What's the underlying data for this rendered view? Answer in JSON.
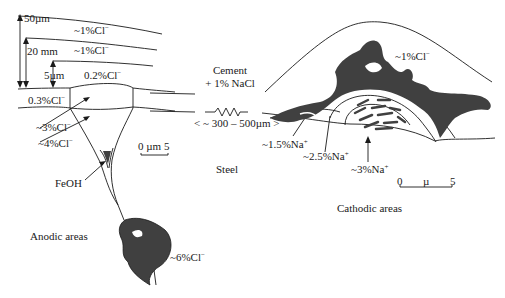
{
  "figure": {
    "type": "schematic diagram"
  },
  "colors": {
    "line": "#1a1a1a",
    "fill_dark": "#404040",
    "background": "#ffffff"
  },
  "left_panel": {
    "dimensions": {
      "outer": "50µm",
      "middle": "20 mm",
      "inner": "5µm"
    },
    "layer_labels": {
      "layer1": "~1%Cl",
      "layer2": "~1%Cl",
      "layer3": "0.2%Cl",
      "layer4": "0.3%Cl"
    },
    "pit_labels": {
      "a": "~3%Cl",
      "b": "~4%Cl",
      "c": "FeOH"
    },
    "scale_bar": "0 µm 5",
    "pit_bottom": "~6%Cl",
    "area_label": "Anodic areas"
  },
  "center": {
    "cement_line1": "Cement",
    "cement_line2": "+ 1% NaCl",
    "distance": "< ~ 300 – 500µm >",
    "steel": "Steel"
  },
  "right_panel": {
    "top_label": "~1%Cl",
    "na_labels": {
      "a": "~1.5%Na",
      "b": "~2.5%Na",
      "c": "~3%Na"
    },
    "scale_bar": {
      "left": "0",
      "mid": "µ",
      "right": "5"
    },
    "area_label": "Cathodic areas"
  },
  "ion_superscripts": {
    "chloride": "−",
    "sodium": "+"
  }
}
